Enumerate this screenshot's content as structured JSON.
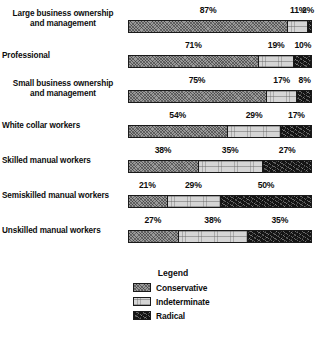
{
  "chart_data": {
    "type": "bar",
    "subtype": "stacked-horizontal-100pct",
    "title": "",
    "xlabel": "",
    "ylabel": "",
    "xlim": [
      0,
      100
    ],
    "grid": false,
    "value_suffix": "%",
    "legend_position": "bottom-center",
    "categories": [
      "Large business ownership and management",
      "Professional",
      "Small business ownership and management",
      "White collar workers",
      "Skilled manual workers",
      "Semiskilled manual workers",
      "Unskilled manual workers"
    ],
    "series": [
      {
        "name": "Conservative",
        "values": [
          87,
          71,
          75,
          54,
          38,
          21,
          27
        ]
      },
      {
        "name": "Indeterminate",
        "values": [
          11,
          19,
          17,
          29,
          35,
          29,
          38
        ]
      },
      {
        "name": "Radical",
        "values": [
          2,
          10,
          8,
          17,
          27,
          50,
          35
        ]
      }
    ]
  },
  "rows": [
    {
      "label_line1": "Large business ownership",
      "label_line2": "and management",
      "two_line": true,
      "segments": [
        {
          "series": "conservative",
          "value": 87,
          "label": "87%"
        },
        {
          "series": "indeterminate",
          "value": 11,
          "label": "11%"
        },
        {
          "series": "radical",
          "value": 2,
          "label": "2%"
        }
      ]
    },
    {
      "label_line1": "Professional",
      "label_line2": "",
      "two_line": false,
      "segments": [
        {
          "series": "conservative",
          "value": 71,
          "label": "71%"
        },
        {
          "series": "indeterminate",
          "value": 19,
          "label": "19%"
        },
        {
          "series": "radical",
          "value": 10,
          "label": "10%"
        }
      ]
    },
    {
      "label_line1": "Small business ownership",
      "label_line2": "and management",
      "two_line": true,
      "segments": [
        {
          "series": "conservative",
          "value": 75,
          "label": "75%"
        },
        {
          "series": "indeterminate",
          "value": 17,
          "label": "17%"
        },
        {
          "series": "radical",
          "value": 8,
          "label": "8%"
        }
      ]
    },
    {
      "label_line1": "White collar workers",
      "label_line2": "",
      "two_line": false,
      "segments": [
        {
          "series": "conservative",
          "value": 54,
          "label": "54%"
        },
        {
          "series": "indeterminate",
          "value": 29,
          "label": "29%"
        },
        {
          "series": "radical",
          "value": 17,
          "label": "17%"
        }
      ]
    },
    {
      "label_line1": "Skilled manual workers",
      "label_line2": "",
      "two_line": false,
      "segments": [
        {
          "series": "conservative",
          "value": 38,
          "label": "38%"
        },
        {
          "series": "indeterminate",
          "value": 35,
          "label": "35%"
        },
        {
          "series": "radical",
          "value": 27,
          "label": "27%"
        }
      ]
    },
    {
      "label_line1": "Semiskilled manual workers",
      "label_line2": "",
      "two_line": false,
      "segments": [
        {
          "series": "conservative",
          "value": 21,
          "label": "21%"
        },
        {
          "series": "indeterminate",
          "value": 29,
          "label": "29%"
        },
        {
          "series": "radical",
          "value": 50,
          "label": "50%"
        }
      ]
    },
    {
      "label_line1": "Unskilled manual workers",
      "label_line2": "",
      "two_line": false,
      "segments": [
        {
          "series": "conservative",
          "value": 27,
          "label": "27%"
        },
        {
          "series": "indeterminate",
          "value": 38,
          "label": "38%"
        },
        {
          "series": "radical",
          "value": 35,
          "label": "35%"
        }
      ]
    }
  ],
  "legend": {
    "title": "Legend",
    "items": [
      {
        "label": "Conservative",
        "series": "conservative"
      },
      {
        "label": "Indeterminate",
        "series": "indeterminate"
      },
      {
        "label": "Radical",
        "series": "radical"
      }
    ]
  },
  "colors": {
    "conservative": "#9a9a9a",
    "indeterminate": "#d5d5d5",
    "radical": "#141414",
    "outline": "#1a1a1a",
    "text": "#0d0d0d",
    "background": "#ffffff"
  },
  "layout": {
    "bar_left_px": 128,
    "bar_width_px": 184,
    "row_height_px": 35,
    "first_row_top_px": 0
  }
}
